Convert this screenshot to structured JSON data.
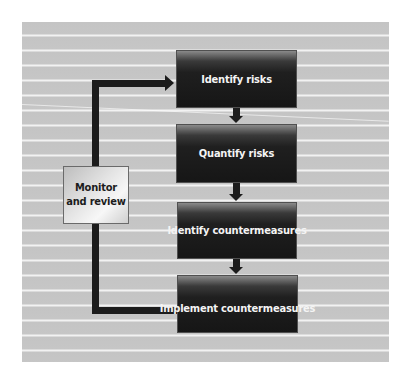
{
  "diagram": {
    "type": "process-flow",
    "steps": [
      {
        "id": "identify-risks",
        "label": "Identify risks"
      },
      {
        "id": "quantify-risks",
        "label": "Quantify risks"
      },
      {
        "id": "identify-countermeasures",
        "label": "Identify countermeasures"
      },
      {
        "id": "implement-countermeasures",
        "label": "Implement countermeasures"
      }
    ],
    "feedback": {
      "label_line1": "Monitor",
      "label_line2": "and review",
      "from": "implement-countermeasures",
      "to": "identify-risks"
    },
    "colors": {
      "background_panel": "#c4c4c4",
      "stripe": "#f2f2f2",
      "step_box": "#161616",
      "step_text": "#f4f4f4",
      "connector": "#1c1c1c",
      "monitor_box": "#e4e4e4"
    }
  }
}
